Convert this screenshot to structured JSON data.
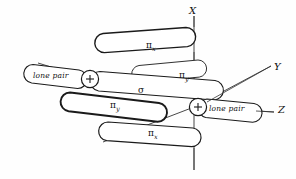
{
  "figure": {
    "background_color": "#fefefe",
    "line_color": "#1a1a1a"
  },
  "axes": [
    {
      "name": "x-axis",
      "label": "X",
      "x": 191,
      "y": 6
    },
    {
      "name": "y-axis",
      "label": "Y",
      "x": 275,
      "y": 65
    },
    {
      "name": "z-axis",
      "label": "Z",
      "x": 279,
      "y": 106
    }
  ],
  "orbitals": [
    {
      "name": "pi-x-upper",
      "label": "π",
      "sub": "x",
      "x": 146,
      "y": 42
    },
    {
      "name": "pi-y-upper",
      "label": "π",
      "sub": "y",
      "x": 179,
      "y": 73
    },
    {
      "name": "sigma",
      "label": "σ",
      "sub": "",
      "x": 138,
      "y": 88
    },
    {
      "name": "pi-y-lower",
      "label": "π",
      "sub": "y",
      "x": 110,
      "y": 103
    },
    {
      "name": "pi-x-lower",
      "label": "π",
      "sub": "x",
      "x": 148,
      "y": 131
    }
  ],
  "lone_pairs": [
    {
      "name": "lone-pair-left",
      "label": "lone pair",
      "x": 32,
      "y": 74
    },
    {
      "name": "lone-pair-right",
      "label": "lone pair",
      "x": 211,
      "y": 107
    }
  ],
  "nuclei": [
    {
      "name": "nucleus-left",
      "label": "+",
      "cx": 90,
      "cy": 79,
      "r": 9
    },
    {
      "name": "nucleus-right",
      "label": "+",
      "cx": 198,
      "cy": 107,
      "r": 9
    }
  ]
}
